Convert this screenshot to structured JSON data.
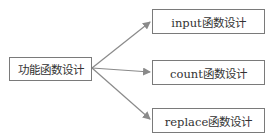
{
  "diagram": {
    "source": {
      "label": "功能函数设计"
    },
    "targets": [
      {
        "label": "input函数设计"
      },
      {
        "label": "count函数设计"
      },
      {
        "label": "replace函数设计"
      }
    ],
    "colors": {
      "border": "#7a7a7a",
      "arrow": "#8a8a8a",
      "text": "#333333"
    }
  }
}
